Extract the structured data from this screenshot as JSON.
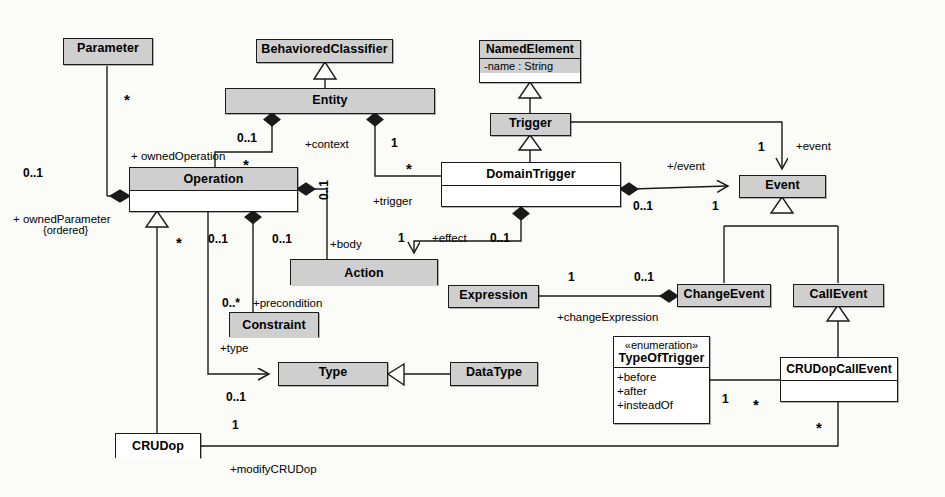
{
  "diagram": {
    "type": "uml-class-diagram"
  },
  "classes": {
    "parameter": {
      "name": "Parameter"
    },
    "behavioredClassifier": {
      "name": "BehavioredClassifier"
    },
    "entity": {
      "name": "Entity"
    },
    "namedElement": {
      "name": "NamedElement",
      "attribute": "-name : String"
    },
    "trigger": {
      "name": "Trigger"
    },
    "operation": {
      "name": "Operation"
    },
    "domainTrigger": {
      "name": "DomainTrigger"
    },
    "event": {
      "name": "Event"
    },
    "action": {
      "name": "Action"
    },
    "constraint": {
      "name": "Constraint"
    },
    "expression": {
      "name": "Expression"
    },
    "changeEvent": {
      "name": "ChangeEvent"
    },
    "callEvent": {
      "name": "CallEvent"
    },
    "type": {
      "name": "Type"
    },
    "dataType": {
      "name": "DataType"
    },
    "crudop": {
      "name": "CRUDop"
    },
    "crudopCallEvent": {
      "name": "CRUDopCallEvent"
    },
    "typeOfTrigger": {
      "stereotype": "«enumeration»",
      "name": "TypeOfTrigger",
      "literals": [
        "+before",
        "+after",
        "+insteadOf"
      ]
    }
  },
  "roles": {
    "ownedOperation": "+ ownedOperation",
    "ownedParameter": "+ ownedParameter",
    "ordered": "{ordered}",
    "context": "+context",
    "trigger": "+trigger",
    "effect": "+effect",
    "body": "+body",
    "precondition": "+precondition",
    "type": "+type",
    "derivedEvent": "+/event",
    "event": "+event",
    "changeExpression": "+changeExpression",
    "modifyCRUDop": "+modifyCRUDop"
  },
  "multiplicities": {
    "param_star": "*",
    "param_0_1": "0..1",
    "ownedOp_0_1": "0..1",
    "ownedOp_star": "*",
    "context_1": "1",
    "trigger_star": "*",
    "op_right_0_1": "0..1",
    "op_star": "*",
    "op_body_0_1": "0..1",
    "op_pre_0_1": "0..1",
    "precondition_0s": "0..*",
    "effect_1": "1",
    "effect_0_1": "0..1",
    "domainTrigger_0_1": "0..1",
    "event_1": "1",
    "trigger_event_1": "1",
    "expr_1": "1",
    "change_0_1": "0..1",
    "type_0_1": "0..1",
    "crudop_1": "1",
    "enum_1": "1",
    "enum_star": "*",
    "crudcall_star": "*"
  }
}
